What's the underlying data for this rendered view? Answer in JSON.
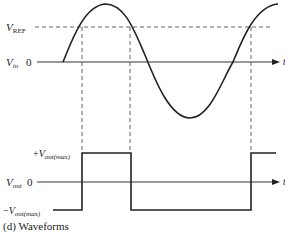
{
  "caption": "(d) Waveforms",
  "input_plot": {
    "vref_label_main": "V",
    "vref_label_sub": "REF",
    "vin_label_main": "V",
    "vin_label_sub": "in",
    "zero_label": "0",
    "t_label": "t"
  },
  "output_plot": {
    "plus_sign": "+",
    "vmax_main": "V",
    "vmax_sub": "out(max)",
    "minus_sign": "−",
    "vout_main": "V",
    "vout_sub": "out",
    "zero_label": "0",
    "t_label": "t"
  },
  "colors": {
    "ink": "#222222",
    "dash": "#555555"
  }
}
